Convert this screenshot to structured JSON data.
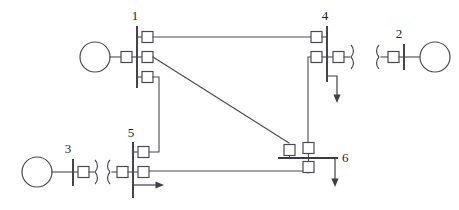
{
  "diagram": {
    "type": "single-line-diagram",
    "background_color": "#ffffff",
    "line_color": "#4a4a52",
    "label_color": "#1d1d22",
    "bus_labels": {
      "bus1": "1",
      "bus2": "2",
      "bus3": "3",
      "bus4": "4",
      "bus5": "5",
      "bus6": "6"
    },
    "buses": [
      {
        "id": "bus1",
        "label": "1",
        "orientation": "vertical",
        "x": 137,
        "y_top": 26,
        "y_bottom": 88,
        "label_x": 135,
        "label_y": 20,
        "breaker_count": 4
      },
      {
        "id": "bus2",
        "label": "2",
        "orientation": "vertical",
        "x": 404,
        "y_top": 44,
        "y_bottom": 70,
        "label_x": 399,
        "label_y": 38,
        "breaker_count": 1
      },
      {
        "id": "bus3",
        "label": "3",
        "orientation": "vertical",
        "x": 73,
        "y_top": 159,
        "y_bottom": 186,
        "label_x": 68,
        "label_y": 153,
        "breaker_count": 1
      },
      {
        "id": "bus4",
        "label": "4",
        "orientation": "vertical",
        "x": 327,
        "y_top": 26,
        "y_bottom": 82,
        "label_x": 325,
        "label_y": 20,
        "breaker_count": 3
      },
      {
        "id": "bus5",
        "label": "5",
        "orientation": "vertical",
        "x": 133,
        "y_top": 142,
        "y_bottom": 198,
        "label_x": 131,
        "label_y": 137,
        "breaker_count": 3
      },
      {
        "id": "bus6",
        "label": "6",
        "orientation": "horizontal",
        "y": 158,
        "x_left": 278,
        "x_right": 338,
        "label_x": 342,
        "label_y": 158,
        "breaker_count": 3
      }
    ],
    "generators": [
      {
        "id": "gen-bus1",
        "cx": 95,
        "cy": 57,
        "r": 15,
        "connects_to": "bus1"
      },
      {
        "id": "gen-bus2",
        "cx": 435,
        "cy": 57,
        "r": 15,
        "connects_to": "bus2"
      },
      {
        "id": "gen-bus3",
        "cx": 37,
        "cy": 172,
        "r": 15,
        "connects_to": "bus3"
      }
    ],
    "transformers": [
      {
        "id": "xfmr-bus4",
        "cx": 356,
        "cy": 57,
        "orientation": "right-of-bus4"
      },
      {
        "id": "xfmr-bus2",
        "cx": 381,
        "cy": 57,
        "orientation": "left-of-bus2"
      },
      {
        "id": "xfmr-bus3",
        "cx": 96,
        "cy": 172,
        "orientation": "right-of-bus3"
      },
      {
        "id": "xfmr-bus5",
        "cx": 110,
        "cy": 172,
        "orientation": "left-of-bus5"
      }
    ],
    "breakers": [
      {
        "id": "bkr-bus1-top",
        "x": 142,
        "y": 32,
        "w": 11,
        "h": 11
      },
      {
        "id": "bkr-bus1-mid",
        "x": 142,
        "y": 52,
        "w": 11,
        "h": 11
      },
      {
        "id": "bkr-bus1-bot",
        "x": 142,
        "y": 72,
        "w": 11,
        "h": 11
      },
      {
        "id": "bkr-bus1-gen",
        "x": 121,
        "y": 52,
        "w": 11,
        "h": 11
      },
      {
        "id": "bkr-bus4-top",
        "x": 311,
        "y": 32,
        "w": 11,
        "h": 11
      },
      {
        "id": "bkr-bus4-mid",
        "x": 311,
        "y": 52,
        "w": 11,
        "h": 11
      },
      {
        "id": "bkr-bus4-right",
        "x": 333,
        "y": 52,
        "w": 11,
        "h": 11
      },
      {
        "id": "bkr-bus2-gen",
        "x": 388,
        "y": 52,
        "w": 11,
        "h": 11
      },
      {
        "id": "bkr-bus3-gen",
        "x": 78,
        "y": 166,
        "w": 11,
        "h": 11
      },
      {
        "id": "bkr-bus5-top",
        "x": 138,
        "y": 147,
        "w": 11,
        "h": 11
      },
      {
        "id": "bkr-bus5-mid",
        "x": 138,
        "y": 166,
        "w": 11,
        "h": 11
      },
      {
        "id": "bkr-bus5-left",
        "x": 117,
        "y": 166,
        "w": 11,
        "h": 11
      },
      {
        "id": "bkr-bus6-left",
        "x": 284,
        "y": 145,
        "w": 11,
        "h": 11
      },
      {
        "id": "bkr-bus6-top",
        "x": 303,
        "y": 143,
        "w": 11,
        "h": 11
      },
      {
        "id": "bkr-bus6-bot",
        "x": 303,
        "y": 162,
        "w": 11,
        "h": 11
      }
    ],
    "lines": [
      {
        "id": "line-1-4",
        "from": "bus1",
        "to": "bus4",
        "path": "M 153 37 L 311 37"
      },
      {
        "id": "line-1-6",
        "from": "bus1",
        "to": "bus6",
        "path": "M 153 57 L 289 143"
      },
      {
        "id": "line-1-5",
        "from": "bus1",
        "to": "bus5",
        "path": "M 153 77 L 159 77 L 159 152 L 149 152"
      },
      {
        "id": "line-4-6",
        "from": "bus4",
        "to": "bus6",
        "path": "M 311 57 L 308 57 L 308 143"
      },
      {
        "id": "line-5-6",
        "from": "bus5",
        "to": "bus6",
        "path": "M 149 171 L 308 171 L 308 173"
      }
    ],
    "loads": [
      {
        "id": "load-bus4",
        "direction": "down",
        "x": 337,
        "y_start": 76,
        "y_end": 102
      },
      {
        "id": "load-bus5",
        "direction": "right",
        "y": 185,
        "x_start": 133,
        "x_end": 163
      },
      {
        "id": "load-bus6",
        "direction": "down",
        "x": 335,
        "y_start": 158,
        "y_end": 186
      }
    ]
  }
}
